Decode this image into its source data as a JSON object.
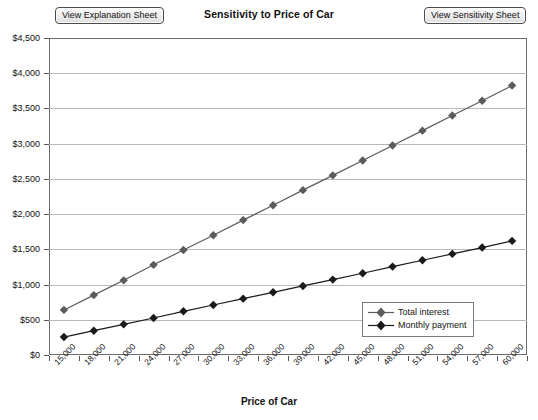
{
  "toolbar": {
    "explanation_button": "View Explanation Sheet",
    "sensitivity_button": "View Sensitivity Sheet"
  },
  "chart_data": {
    "type": "line",
    "title": "Sensitivity to Price of Car",
    "xlabel": "Price of Car",
    "ylabel": "",
    "grid": true,
    "legend_position": "inside-bottom-right",
    "ylim": [
      0,
      4500
    ],
    "ytick_labels": [
      "$4,500",
      "$4,000",
      "$3,500",
      "$3,000",
      "$2,500",
      "$2,000",
      "$1,500",
      "$1,000",
      "$500",
      "$0"
    ],
    "ytick_values": [
      4500,
      4000,
      3500,
      3000,
      2500,
      2000,
      1500,
      1000,
      500,
      0
    ],
    "categories": [
      "15,000",
      "18,000",
      "21,000",
      "24,000",
      "27,000",
      "30,000",
      "33,000",
      "36,000",
      "39,000",
      "42,000",
      "45,000",
      "48,000",
      "51,000",
      "54,000",
      "57,000",
      "60,000"
    ],
    "series": [
      {
        "name": "Total interest",
        "color": "#5b5b5b",
        "marker": "diamond",
        "values": [
          640,
          850,
          1060,
          1280,
          1490,
          1700,
          1915,
          2125,
          2340,
          2550,
          2760,
          2975,
          3185,
          3400,
          3610,
          3825
        ]
      },
      {
        "name": "Monthly payment",
        "color": "#1a1a1a",
        "marker": "diamond",
        "values": [
          255,
          345,
          435,
          525,
          620,
          710,
          800,
          890,
          980,
          1070,
          1160,
          1255,
          1345,
          1435,
          1525,
          1620
        ]
      }
    ]
  }
}
